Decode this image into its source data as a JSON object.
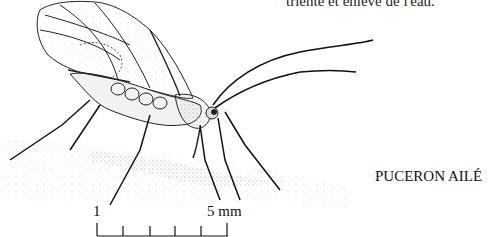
{
  "figure": {
    "caption_top": "triente et enlève de l'eau.",
    "title": "PUCERON AILÉ",
    "scale_bar": {
      "start_label": "1",
      "end_label": "5 mm",
      "ticks": 6
    }
  }
}
